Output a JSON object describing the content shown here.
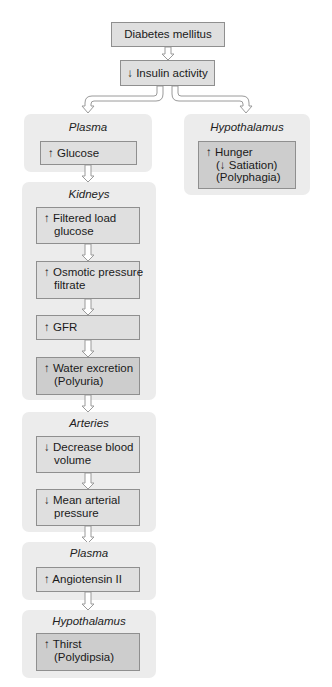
{
  "diagram": {
    "root": {
      "label": "Diabetes mellitus"
    },
    "insulin": {
      "label": "↓ Insulin activity"
    },
    "left_column": {
      "plasma_1": {
        "title": "Plasma",
        "items": [
          {
            "lines": [
              "↑ Glucose"
            ]
          }
        ]
      },
      "kidneys": {
        "title": "Kidneys",
        "items": [
          {
            "lines": [
              "↑ Filtered load",
              "glucose"
            ]
          },
          {
            "lines": [
              "↑ Osmotic pressure",
              "filtrate"
            ]
          },
          {
            "lines": [
              "↑ GFR"
            ]
          },
          {
            "lines": [
              "↑ Water excretion",
              "(Polyuria)"
            ],
            "emphasis": true
          }
        ]
      },
      "arteries": {
        "title": "Arteries",
        "items": [
          {
            "lines": [
              "↓ Decrease blood",
              "volume"
            ]
          },
          {
            "lines": [
              "↓ Mean arterial",
              "pressure"
            ]
          }
        ]
      },
      "plasma_2": {
        "title": "Plasma",
        "items": [
          {
            "lines": [
              "↑ Angiotensin II"
            ]
          }
        ]
      },
      "hypothalamus_2": {
        "title": "Hypothalamus",
        "items": [
          {
            "lines": [
              "↑ Thirst",
              "(Polydipsia)"
            ],
            "emphasis": true
          }
        ]
      }
    },
    "right_column": {
      "hypothalamus_1": {
        "title": "Hypothalamus",
        "items": [
          {
            "lines": [
              "↑ Hunger",
              "(↓ Satiation)",
              "(Polyphagia)"
            ],
            "emphasis": true
          }
        ]
      }
    },
    "colors": {
      "panel_bg": "#ececec",
      "box_bg": "#dfdfdf",
      "box_emphasis_bg": "#cdcdcd",
      "box_border": "#8f8f8f",
      "arrow_stroke": "#9a9a9a"
    }
  }
}
